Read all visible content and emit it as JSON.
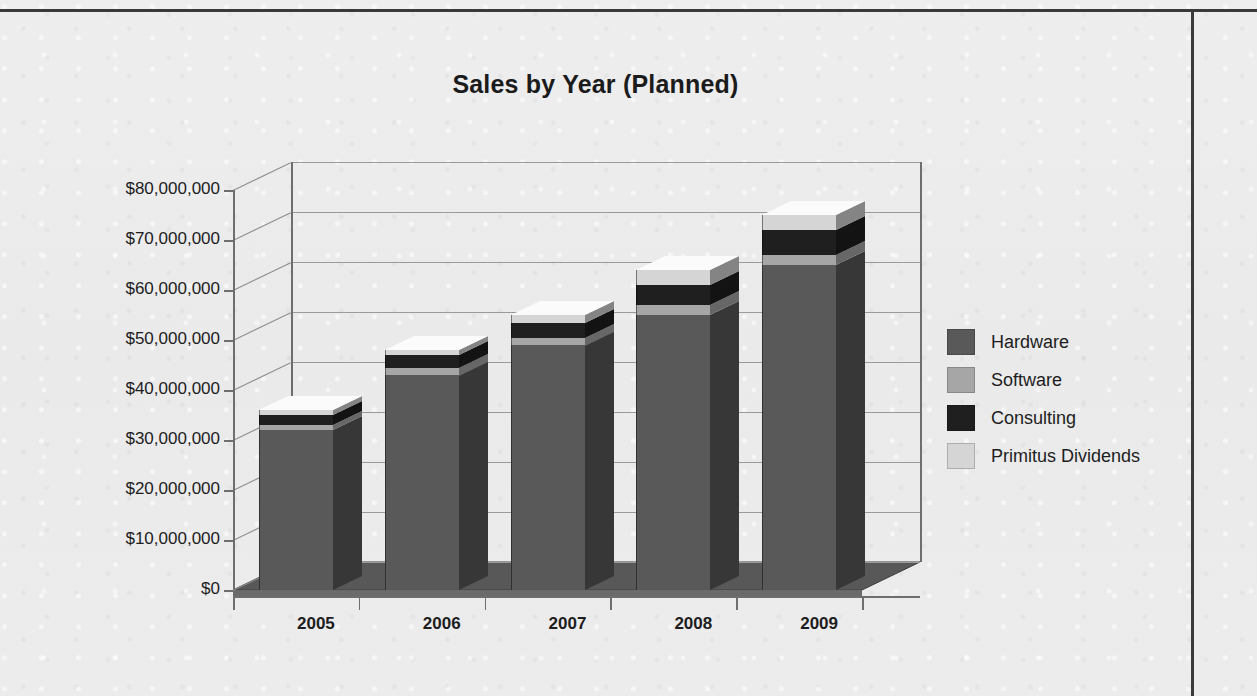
{
  "chart_data": {
    "type": "bar",
    "subtype": "stacked-3d-column",
    "title": "Sales by Year (Planned)",
    "xlabel": "",
    "ylabel": "",
    "categories": [
      "2005",
      "2006",
      "2007",
      "2008",
      "2009"
    ],
    "series": [
      {
        "name": "Hardware",
        "color": "#595959",
        "values": [
          32000000,
          43000000,
          49000000,
          55000000,
          65000000
        ]
      },
      {
        "name": "Software",
        "color": "#a6a6a6",
        "values": [
          1000000,
          1500000,
          1500000,
          2000000,
          2000000
        ]
      },
      {
        "name": "Consulting",
        "color": "#1f1f1f",
        "values": [
          2000000,
          2500000,
          3000000,
          4000000,
          5000000
        ]
      },
      {
        "name": "Primitus Dividends",
        "color": "#d5d5d5",
        "values": [
          1000000,
          1000000,
          1500000,
          3000000,
          3000000
        ]
      }
    ],
    "totals": [
      36000000,
      48000000,
      55000000,
      64000000,
      75000000
    ],
    "ylim": [
      0,
      80000000
    ],
    "ytick_values": [
      0,
      10000000,
      20000000,
      30000000,
      40000000,
      50000000,
      60000000,
      70000000,
      80000000
    ],
    "ytick_labels": [
      "$0",
      "$10,000,000",
      "$20,000,000",
      "$30,000,000",
      "$40,000,000",
      "$50,000,000",
      "$60,000,000",
      "$70,000,000",
      "$80,000,000"
    ],
    "grid": true,
    "legend_position": "right",
    "legend_entries": [
      "Hardware",
      "Software",
      "Consulting",
      "Primitus Dividends"
    ]
  },
  "legend": {
    "items": [
      {
        "label": "Hardware"
      },
      {
        "label": "Software"
      },
      {
        "label": "Consulting"
      },
      {
        "label": "Primitus Dividends"
      }
    ]
  }
}
